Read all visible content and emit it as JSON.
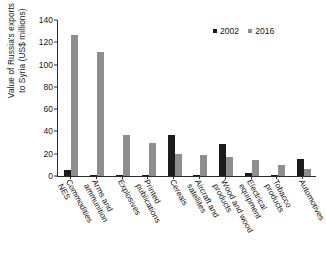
{
  "chart_data": {
    "type": "bar",
    "title": "",
    "subtitle": "",
    "xlabel": "",
    "ylabel": "Value of Russia's exports\nto Syria (US$ millions)",
    "ylim": [
      0,
      140
    ],
    "yticks": [
      0,
      20,
      40,
      60,
      80,
      100,
      120,
      140
    ],
    "ytick_labels": [
      "0",
      "20",
      "40",
      "60",
      "80",
      "100",
      "120",
      "140"
    ],
    "grid": false,
    "legend_position": "top-right",
    "categories": [
      "Commodities\nNES",
      "Arms and\nammunition",
      "Explosives",
      "Printed\npublications",
      "Cereals",
      "Aircraft and\nsatellites",
      "Wood and wood\nproducts",
      "Electrical\nequipment",
      "Tobacco\nproducts",
      "Automotives"
    ],
    "series": [
      {
        "name": "2002",
        "color": "#1c1c1c",
        "values": [
          5,
          0.5,
          0.5,
          0.5,
          36.5,
          0.5,
          29,
          3,
          0.5,
          15.5
        ]
      },
      {
        "name": "2016",
        "color": "#8e8e8e",
        "values": [
          127,
          111,
          37,
          30,
          20,
          19,
          17.5,
          14.5,
          10,
          6
        ]
      }
    ]
  },
  "legend": {
    "items": [
      {
        "label": "2002",
        "color": "#1c1c1c"
      },
      {
        "label": "2016",
        "color": "#8e8e8e"
      }
    ]
  }
}
